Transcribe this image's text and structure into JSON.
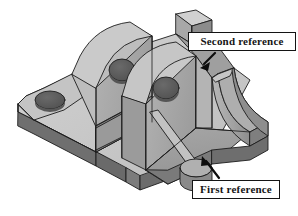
{
  "figure": {
    "background_color": "#ffffff",
    "width": 298,
    "height": 216
  },
  "annotations": [
    {
      "id": "second-reference",
      "label": "Second reference",
      "box": {
        "x": 188,
        "y": 32,
        "width": 108,
        "height": 19
      },
      "border_color": "#141414",
      "fill_color": "#ffffff",
      "arrow": {
        "from_x": 215,
        "from_y": 53,
        "to_x": 202,
        "to_y": 66,
        "color": "#0d0d0d"
      }
    },
    {
      "id": "first-reference",
      "label": "First reference",
      "box": {
        "x": 192,
        "y": 180,
        "width": 88,
        "height": 19
      },
      "border_color": "#141414",
      "fill_color": "#ffffff",
      "arrow": {
        "from_x": 219,
        "from_y": 178,
        "to_x": 203,
        "to_y": 158,
        "color": "#0d0d0d"
      }
    }
  ],
  "part": {
    "name": "bracket-isometric",
    "rendering": "shaded-grayscale-isometric",
    "outline_color": "#1c1c1c",
    "surfaces": {
      "top_light": "#c8c8c8",
      "top_flange": "#c0c0c0",
      "rib_face": "#a8a8a8",
      "floor_mid": "#9c9c9c",
      "side_dark": "#808080",
      "front_edge": "#6f6f6f",
      "shadow_deep": "#5e5e5e",
      "hole_dark": "#5a5a5a",
      "highlight": "#d6d6d6"
    },
    "features": [
      {
        "name": "base-plate",
        "description": "flat lower plate with rounded left corner and rectangular notch"
      },
      {
        "name": "left-flange-hole",
        "description": "circular through hole in left flange"
      },
      {
        "name": "rear-rib",
        "description": "upright rib with circular hole"
      },
      {
        "name": "front-rib",
        "description": "upright rib with circular hole"
      },
      {
        "name": "fillet-curve",
        "description": "concave curved wall on right side"
      },
      {
        "name": "floor-pocket",
        "description": "recessed flat floor, first datum face"
      },
      {
        "name": "diagonal-rib",
        "description": "angled stiffener rib across floor"
      },
      {
        "name": "boss-cylinder",
        "description": "small cylindrical boss at lower right"
      },
      {
        "name": "top-tab",
        "description": "raised rectangular tab at top of part"
      }
    ]
  }
}
